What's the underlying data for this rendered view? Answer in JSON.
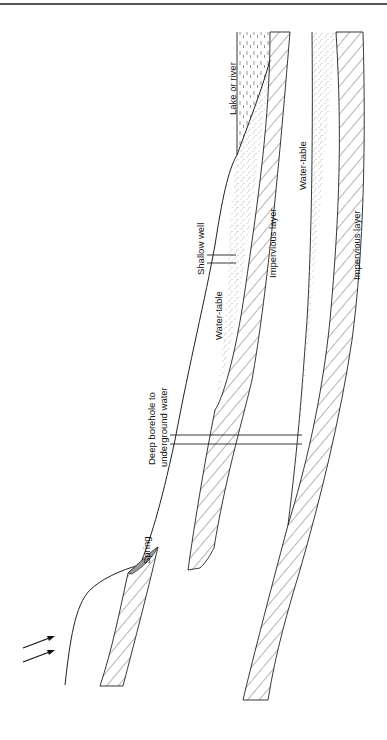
{
  "diagram": {
    "type": "geological cross-section",
    "labels": {
      "lake": "Lake or river",
      "water_table_upper": "Water-table",
      "water_table_lower": "Water-table",
      "shallow_well": "Shallow well",
      "impervious_upper": "Impervious layer",
      "impervious_lower": "Impervious layer",
      "borehole_line1": "Deep borehole to",
      "borehole_line2": "underground water",
      "spring": "Spring"
    },
    "indicators": {
      "rain_arrows": 2
    },
    "colors": {
      "line": "#222222",
      "hatch": "#444444",
      "stipple": "#555555",
      "background": "#ffffff"
    }
  }
}
